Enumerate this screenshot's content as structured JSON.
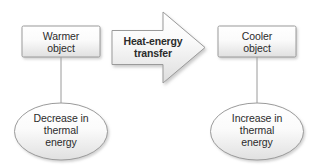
{
  "diagram": {
    "colors": {
      "shape_fill_top": "#ffffff",
      "shape_fill_bottom": "#e3e3e3",
      "shape_stroke": "#9a9a9a",
      "text": "#2b2b2b",
      "connector": "#9a9a9a",
      "background": "#ffffff",
      "shadow": "#b9b9b9"
    },
    "nodes": {
      "warmer_box": {
        "label": "Warmer\nobject",
        "shape": "rounded-rectangle"
      },
      "cooler_box": {
        "label": "Cooler\nobject",
        "shape": "rounded-rectangle"
      },
      "transfer_arrow": {
        "label": "Heat-energy\ntransfer",
        "shape": "block-arrow-right",
        "direction": "left-to-right"
      },
      "decrease_ellipse": {
        "label": "Decrease in\nthermal\nenergy",
        "shape": "ellipse"
      },
      "increase_ellipse": {
        "label": "Increase in\nthermal\nenergy",
        "shape": "ellipse"
      }
    },
    "connectors": [
      {
        "name": "warmer-to-decrease",
        "from": "warmer_box",
        "to": "decrease_ellipse"
      },
      {
        "name": "cooler-to-increase",
        "from": "cooler_box",
        "to": "increase_ellipse"
      }
    ]
  }
}
